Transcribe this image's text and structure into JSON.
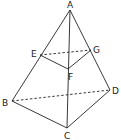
{
  "diagram": {
    "type": "tetrahedron-section",
    "points": {
      "A": {
        "label": "A",
        "x": 70,
        "y": 10,
        "lx": 67,
        "ly": 8
      },
      "B": {
        "label": "B",
        "x": 12,
        "y": 101,
        "lx": 2,
        "ly": 106
      },
      "C": {
        "label": "C",
        "x": 67,
        "y": 128,
        "lx": 64,
        "ly": 139
      },
      "D": {
        "label": "D",
        "x": 110,
        "y": 90,
        "lx": 112,
        "ly": 94
      },
      "E": {
        "label": "E",
        "x": 40,
        "y": 55,
        "lx": 31,
        "ly": 57
      },
      "F": {
        "label": "F",
        "x": 68,
        "y": 69,
        "lx": 68,
        "ly": 80
      },
      "G": {
        "label": "G",
        "x": 91,
        "y": 50,
        "lx": 93,
        "ly": 53
      }
    },
    "solid_edges": [
      [
        "A",
        "B"
      ],
      [
        "A",
        "C"
      ],
      [
        "A",
        "D"
      ],
      [
        "B",
        "C"
      ],
      [
        "C",
        "D"
      ],
      [
        "E",
        "F"
      ],
      [
        "F",
        "G"
      ]
    ],
    "dashed_edges": [
      [
        "E",
        "G"
      ],
      [
        "B",
        "D"
      ]
    ],
    "colors": {
      "line": "#222222",
      "background": "#ffffff"
    }
  }
}
